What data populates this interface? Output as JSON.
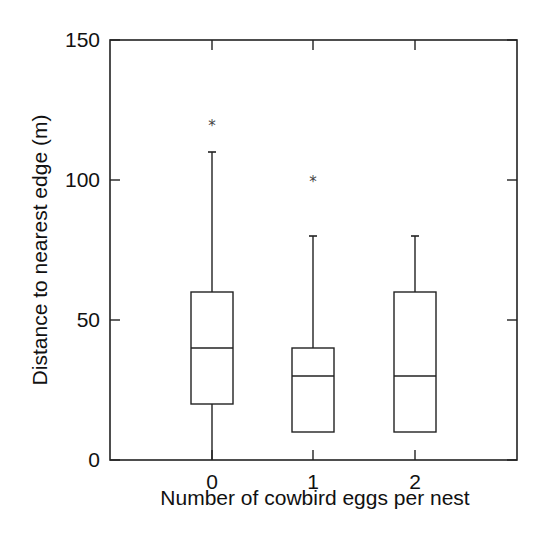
{
  "chart_data": {
    "type": "box",
    "title": "",
    "xlabel": "Number of cowbird eggs per nest",
    "ylabel": "Distance to nearest edge (m)",
    "categories": [
      "0",
      "1",
      "2"
    ],
    "ylim": [
      0,
      150
    ],
    "yticks": [
      0,
      50,
      100,
      150
    ],
    "grid": false,
    "legend": null,
    "series": [
      {
        "category": "0",
        "whisker_low": 0,
        "q1": 20,
        "median": 40,
        "q3": 60,
        "whisker_high": 110,
        "outliers": [
          120
        ]
      },
      {
        "category": "1",
        "whisker_low": 10,
        "q1": 10,
        "median": 30,
        "q3": 40,
        "whisker_high": 80,
        "outliers": [
          100
        ]
      },
      {
        "category": "2",
        "whisker_low": 10,
        "q1": 10,
        "median": 30,
        "q3": 60,
        "whisker_high": 80,
        "outliers": []
      }
    ],
    "colors": {
      "line": "#222222",
      "background": "#ffffff"
    }
  }
}
